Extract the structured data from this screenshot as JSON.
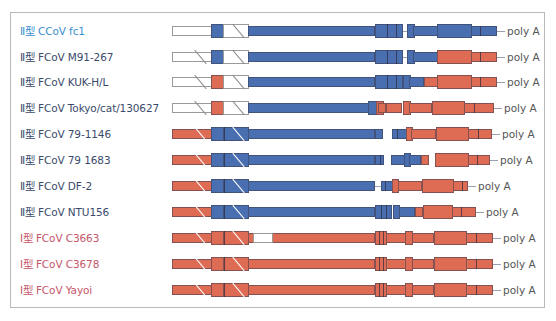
{
  "figure": {
    "border_color": "#b9b9b9",
    "colors": {
      "type2_block": "#4a6fb0",
      "type1_block": "#de6b53",
      "utr_white": "#ffffff",
      "label_type2_ccov": "#3a8fd0",
      "label_type2": "#3a4a6a",
      "label_type1": "#c4566a"
    },
    "tail_label": "poly A",
    "rows": [
      {
        "type": "Ⅱ型",
        "name": "CCoV fc1",
        "label_color": "#3a8fd0"
      },
      {
        "type": "Ⅱ型",
        "name": "FCoV M91-267",
        "label_color": "#3a4a6a"
      },
      {
        "type": "Ⅱ型",
        "name": "FCoV KUK-H/L",
        "label_color": "#3a4a6a"
      },
      {
        "type": "Ⅱ型",
        "name": "FCoV Tokyo/cat/130627",
        "label_color": "#3a4a6a"
      },
      {
        "type": "Ⅱ型",
        "name": "FCoV 79-1146",
        "label_color": "#3a4a6a"
      },
      {
        "type": "Ⅱ型",
        "name": "FCoV 79 1683",
        "label_color": "#3a4a6a"
      },
      {
        "type": "Ⅱ型",
        "name": "FCoV DF-2",
        "label_color": "#3a4a6a"
      },
      {
        "type": "Ⅱ型",
        "name": "FCoV NTU156",
        "label_color": "#3a4a6a"
      },
      {
        "type": "Ⅰ型",
        "name": "FCoV C3663",
        "label_color": "#c4566a"
      },
      {
        "type": "Ⅰ型",
        "name": "FCoV C3678",
        "label_color": "#c4566a"
      },
      {
        "type": "Ⅰ型",
        "name": "FCoV Yayoi",
        "label_color": "#c4566a"
      }
    ]
  }
}
